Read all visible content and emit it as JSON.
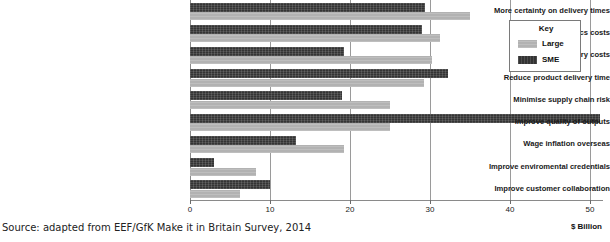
{
  "chart_data": {
    "type": "bar",
    "orientation": "horizontal",
    "title": "",
    "xlabel": "$ Billion",
    "ylabel": "",
    "xlim": [
      0,
      51.6
    ],
    "xticks": [
      0,
      10,
      20,
      30,
      40,
      50
    ],
    "xticklabels": [
      "0",
      "10",
      "20",
      "30",
      "40",
      "50"
    ],
    "grid": true,
    "legend_position": "top-right",
    "legend_title": "Key",
    "categories": [
      "More certainty on delivery times",
      "Minimise logistics costs",
      "Reduce inventry costs",
      "Reduce product delivery time",
      "Minimise supply chain risk",
      "Improve quality of outputs",
      "Wage inflation overseas",
      "Improve enviromental credentials",
      "Improve customer collaboration"
    ],
    "series": [
      {
        "name": "SME",
        "color": "#343434",
        "values": [
          29.4,
          29.0,
          19.2,
          32.3,
          19.0,
          51.3,
          13.3,
          3.0,
          10.0
        ]
      },
      {
        "name": "Large",
        "color": "#b2b2b2",
        "values": [
          35.0,
          31.3,
          30.3,
          29.3,
          25.0,
          25.0,
          19.3,
          8.3,
          6.3
        ]
      }
    ]
  },
  "legend": {
    "title": "Key",
    "entries": [
      {
        "label": "Large",
        "swatch": "large"
      },
      {
        "label": "SME",
        "swatch": "sme"
      }
    ]
  },
  "axis": {
    "x_title": "$ Billion"
  },
  "source": {
    "text": "Source: adapted from EEF/GfK Make it in Britain Survey, 2014"
  }
}
